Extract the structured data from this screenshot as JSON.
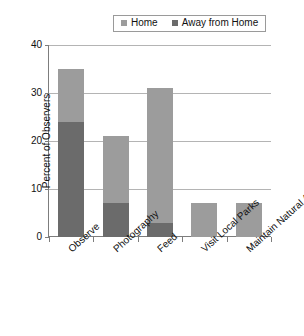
{
  "chart_data": {
    "type": "bar",
    "subtype": "stacked-bar",
    "title": "",
    "xlabel": "",
    "ylabel": "Percent of Observers",
    "ylim": [
      0,
      40
    ],
    "yticks": [
      0,
      10,
      20,
      30,
      40
    ],
    "grid": true,
    "legend_position": "top",
    "categories": [
      "Observe",
      "Photography",
      "Feed",
      "Visit Local Parks",
      "Maintain Natural Area"
    ],
    "series": [
      {
        "name": "Away from Home",
        "color": "#6b6b6b",
        "values": [
          24,
          7,
          3,
          0,
          0
        ]
      },
      {
        "name": "Home",
        "color": "#9c9c9c",
        "values": [
          11,
          14,
          28,
          7,
          7
        ]
      }
    ],
    "totals": [
      35,
      21,
      31,
      7,
      7
    ]
  },
  "legend": {
    "items": [
      {
        "label": "Home",
        "color": "#9c9c9c"
      },
      {
        "label": "Away from Home",
        "color": "#6b6b6b"
      }
    ]
  },
  "axis": {
    "y_title": "Percent of Observers",
    "y_tick_labels": [
      "40",
      "30",
      "20",
      "10",
      "0"
    ]
  }
}
